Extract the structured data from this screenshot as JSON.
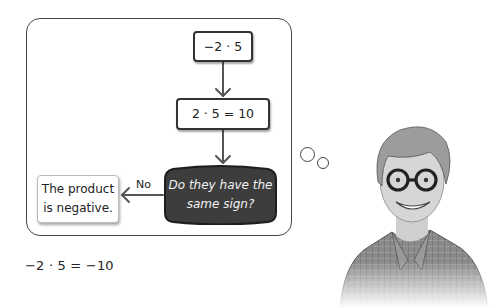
{
  "flowchart": {
    "start_box": "−2 · 5",
    "step_box": "2 · 5 = 10",
    "decision": "Do they have the same sign?",
    "decision_line1": "Do they have the",
    "decision_line2": "same sign?",
    "branch_label": "No",
    "result_box_line1": "The product",
    "result_box_line2": "is negative.",
    "colors": {
      "decision_fill": "#3d3d3d",
      "border": "#333333",
      "arrow": "#555555"
    }
  },
  "equation": "−2 · 5 = −10",
  "illustration": {
    "subject": "smiling student with glasses, thinking",
    "thought_bubbles": 2
  }
}
